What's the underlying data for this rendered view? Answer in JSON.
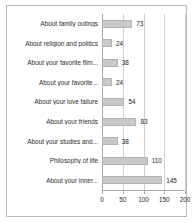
{
  "chart_data": {
    "type": "bar",
    "orientation": "horizontal",
    "title": "",
    "subtitle": "",
    "xlabel": "",
    "ylabel": "",
    "xlim": [
      0,
      200
    ],
    "xticks": [
      0,
      50,
      100,
      150,
      200
    ],
    "xtick_labels": [
      "0",
      "50",
      "100",
      "150",
      "200"
    ],
    "grid": true,
    "legend": null,
    "show_data_labels": true,
    "bar_color": "#c9c9c9",
    "bar_edge_color": "#b3b3b3",
    "grid_color": "#cfcfcf",
    "axis_color": "#a8a8a8",
    "background_color": "#ffffff",
    "border_color": "#b9b9b9",
    "text_color": "#2b2b2b",
    "categories": [
      "About family outings",
      "About religion and politics",
      "About your favorite film...",
      "About your favorite...",
      "About your love failure",
      "About your friends",
      "About your studies and...",
      "Philosophy of life",
      "About your inner..."
    ],
    "values": [
      73,
      24,
      38,
      24,
      54,
      83,
      38,
      110,
      145
    ],
    "value_labels": [
      "73",
      "24",
      "38",
      "24",
      "54",
      "83",
      "38",
      "110",
      "145"
    ]
  }
}
